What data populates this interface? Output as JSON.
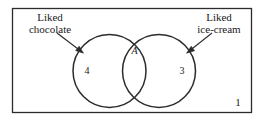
{
  "figure": {
    "type": "venn-diagram",
    "stroke_color": "#2b2b2b",
    "text_color": "#1a1a1a",
    "background_color": "#ffffff"
  },
  "universal_set": {
    "label": "1"
  },
  "sets": {
    "left": {
      "callout_line1": "Liked",
      "callout_line2": "chocolate",
      "count": "4"
    },
    "right": {
      "callout_line1": "Liked",
      "callout_line2": "ice-cream",
      "count": "3"
    },
    "intersection": {
      "label": "A"
    }
  }
}
